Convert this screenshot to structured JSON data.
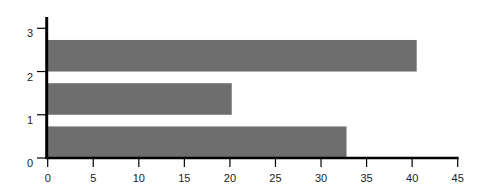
{
  "chart_data": {
    "type": "bar",
    "orientation": "horizontal",
    "title": "",
    "xlabel": "",
    "ylabel": "",
    "categories": [
      "0",
      "1",
      "2"
    ],
    "values": [
      32.8,
      20.2,
      40.5
    ],
    "xlim": [
      0,
      45
    ],
    "ylim": [
      0,
      3
    ],
    "x_ticks": [
      "0",
      "5",
      "10",
      "15",
      "20",
      "25",
      "30",
      "35",
      "40",
      "45"
    ],
    "y_ticks": [
      "0",
      "1",
      "2",
      "3"
    ],
    "grid": false,
    "legend": null,
    "bar_span": 0.73,
    "bar_color": "#6e6e6e",
    "axis_color": "#000000"
  }
}
